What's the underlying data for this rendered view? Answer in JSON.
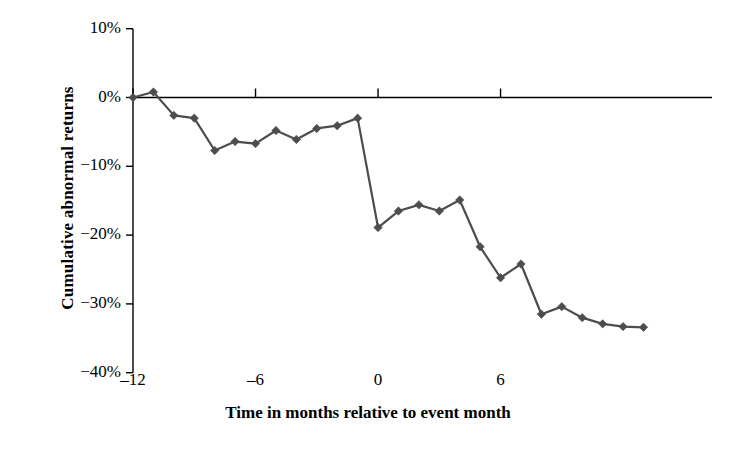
{
  "chart_data": {
    "type": "line",
    "title": "",
    "xlabel": "Time in months relative to event month",
    "ylabel": "Cumulative abnormal returns",
    "xlim": [
      -12,
      3.5
    ],
    "ylim": [
      -40,
      10
    ],
    "grid": false,
    "legend": "none",
    "xtick_labels": [
      "‒12",
      "‒6",
      "0",
      "6"
    ],
    "xtick_values": [
      -12,
      -6,
      0,
      6
    ],
    "ytick_labels": [
      "10%",
      "0%",
      "−10%",
      "−20%",
      "−30%",
      "−40%"
    ],
    "ytick_values": [
      10,
      0,
      -10,
      -20,
      -30,
      -40
    ],
    "series": [
      {
        "name": "Cumulative abnormal return",
        "color": "#4d4d4d",
        "marker": "diamond",
        "x": [
          -12,
          -11,
          -10,
          -9,
          -8,
          -7,
          -6,
          -5,
          -4,
          -3,
          -2,
          -1,
          0,
          1,
          2,
          3,
          4,
          5,
          6,
          7,
          8,
          9,
          10,
          11,
          12,
          13
        ],
        "values": [
          0.0,
          0.8,
          -2.6,
          -3.0,
          -7.7,
          -6.4,
          -6.7,
          -4.8,
          -6.1,
          -4.5,
          -4.1,
          -3.0,
          -18.9,
          -16.5,
          -15.6,
          -16.5,
          -14.9,
          -21.7,
          -26.2,
          -24.2,
          -31.5,
          -30.4,
          -32.0,
          -32.9,
          -33.3,
          -33.4
        ]
      }
    ]
  },
  "axis": {
    "y_title": "Cumulative abnormal returns",
    "x_title": "Time in months relative to event month"
  },
  "colors": {
    "line": "#4d4d4d",
    "marker": "#4d4d4d",
    "axis": "#000000",
    "background": "#ffffff"
  }
}
